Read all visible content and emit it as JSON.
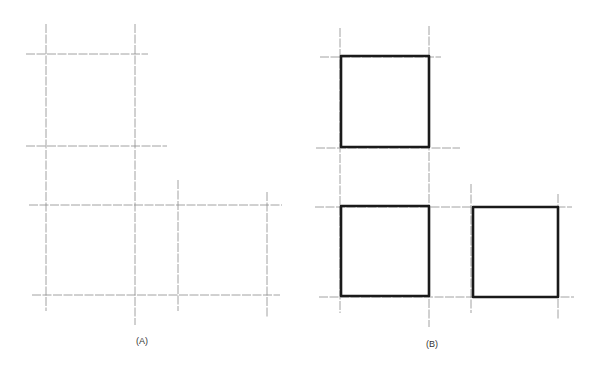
{
  "colors": {
    "background": "#ffffff",
    "guide_line": "#8a8a8a",
    "bold_square": "#1a1a1a",
    "label": "#333333"
  },
  "panels": [
    {
      "id": "A",
      "label": "(A)",
      "label_pos": {
        "x": 142,
        "y": 336
      },
      "vertical_guides": [
        {
          "x": 46,
          "y1": 24,
          "y2": 311
        },
        {
          "x": 135,
          "y1": 24,
          "y2": 325
        },
        {
          "x": 178,
          "y1": 180,
          "y2": 311
        },
        {
          "x": 267,
          "y1": 192,
          "y2": 317
        }
      ],
      "horizontal_guides": [
        {
          "y": 54,
          "x1": 26,
          "x2": 148
        },
        {
          "y": 146,
          "x1": 26,
          "x2": 167
        },
        {
          "y": 205,
          "x1": 29,
          "x2": 282
        },
        {
          "y": 295,
          "x1": 32,
          "x2": 280
        }
      ],
      "bold_squares": []
    },
    {
      "id": "B",
      "label": "(B)",
      "label_pos": {
        "x": 432,
        "y": 339
      },
      "vertical_guides": [
        {
          "x": 340,
          "y1": 28,
          "y2": 313
        },
        {
          "x": 429,
          "y1": 26,
          "y2": 327
        },
        {
          "x": 471,
          "y1": 184,
          "y2": 313
        },
        {
          "x": 558,
          "y1": 194,
          "y2": 320
        }
      ],
      "horizontal_guides": [
        {
          "y": 57,
          "x1": 320,
          "x2": 441
        },
        {
          "y": 148,
          "x1": 316,
          "x2": 460
        },
        {
          "y": 207,
          "x1": 315,
          "x2": 572
        },
        {
          "y": 297,
          "x1": 319,
          "x2": 574
        }
      ],
      "bold_squares": [
        {
          "x": 341,
          "y": 56,
          "w": 88,
          "h": 91
        },
        {
          "x": 341,
          "y": 206,
          "w": 88,
          "h": 90
        },
        {
          "x": 473,
          "y": 207,
          "w": 85,
          "h": 90
        }
      ]
    }
  ]
}
